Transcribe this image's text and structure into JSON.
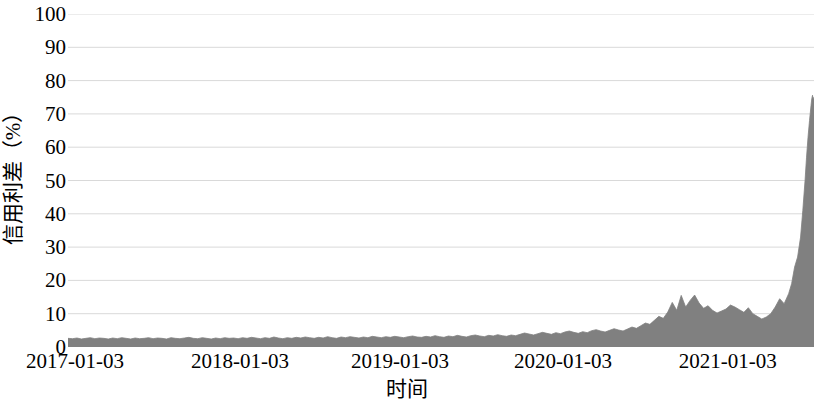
{
  "chart_data": {
    "type": "area",
    "title": "",
    "xlabel": "时间",
    "ylabel": "信用利差（%）",
    "ylim": [
      0,
      100
    ],
    "yticks": [
      0,
      10,
      20,
      30,
      40,
      50,
      60,
      70,
      80,
      90,
      100
    ],
    "ytick_labels": [
      "0",
      "10",
      "20",
      "30",
      "40",
      "50",
      "60",
      "70",
      "80",
      "90",
      "100"
    ],
    "xticks": [
      "2017-01-03",
      "2018-01-03",
      "2019-01-03",
      "2020-01-03",
      "2021-01-03"
    ],
    "xtick_positions_frac": [
      0.0094,
      0.2305,
      0.445,
      0.6634,
      0.8845
    ],
    "grid": true,
    "grid_color": "#d9d9d9",
    "legend": "none",
    "series": [
      {
        "name": "信用利差",
        "color": "#808080",
        "fill": "#808080",
        "x": [
          0.0,
          0.006,
          0.012,
          0.018,
          0.024,
          0.03,
          0.036,
          0.042,
          0.048,
          0.054,
          0.06,
          0.066,
          0.072,
          0.078,
          0.084,
          0.09,
          0.096,
          0.102,
          0.108,
          0.114,
          0.12,
          0.126,
          0.132,
          0.138,
          0.144,
          0.15,
          0.156,
          0.162,
          0.168,
          0.174,
          0.18,
          0.186,
          0.192,
          0.198,
          0.204,
          0.21,
          0.216,
          0.222,
          0.228,
          0.234,
          0.24,
          0.246,
          0.252,
          0.258,
          0.264,
          0.27,
          0.276,
          0.282,
          0.288,
          0.294,
          0.3,
          0.306,
          0.312,
          0.318,
          0.324,
          0.33,
          0.336,
          0.342,
          0.348,
          0.354,
          0.36,
          0.366,
          0.372,
          0.378,
          0.384,
          0.39,
          0.396,
          0.402,
          0.408,
          0.414,
          0.42,
          0.426,
          0.432,
          0.438,
          0.444,
          0.45,
          0.456,
          0.462,
          0.468,
          0.474,
          0.48,
          0.486,
          0.492,
          0.498,
          0.504,
          0.51,
          0.516,
          0.522,
          0.528,
          0.534,
          0.54,
          0.546,
          0.552,
          0.558,
          0.564,
          0.57,
          0.576,
          0.582,
          0.588,
          0.594,
          0.6,
          0.606,
          0.612,
          0.618,
          0.624,
          0.63,
          0.636,
          0.642,
          0.648,
          0.654,
          0.66,
          0.666,
          0.672,
          0.678,
          0.684,
          0.69,
          0.696,
          0.702,
          0.708,
          0.714,
          0.72,
          0.726,
          0.732,
          0.738,
          0.744,
          0.75,
          0.756,
          0.762,
          0.768,
          0.774,
          0.78,
          0.786,
          0.792,
          0.798,
          0.804,
          0.81,
          0.816,
          0.822,
          0.828,
          0.834,
          0.84,
          0.846,
          0.852,
          0.858,
          0.864,
          0.87,
          0.876,
          0.882,
          0.888,
          0.894,
          0.9,
          0.906,
          0.912,
          0.918,
          0.924,
          0.93,
          0.936,
          0.942,
          0.948,
          0.954,
          0.96,
          0.966,
          0.97,
          0.974,
          0.978,
          0.982,
          0.985,
          0.988,
          0.99,
          0.992,
          0.994,
          0.996,
          0.997,
          0.998,
          0.999,
          1.0
        ],
        "y": [
          2.6,
          2.5,
          2.7,
          2.4,
          2.6,
          2.8,
          2.5,
          2.7,
          2.6,
          2.4,
          2.7,
          2.5,
          2.8,
          2.6,
          2.4,
          2.7,
          2.5,
          2.6,
          2.8,
          2.5,
          2.7,
          2.6,
          2.4,
          2.8,
          2.6,
          2.5,
          2.7,
          2.9,
          2.6,
          2.5,
          2.8,
          2.6,
          2.4,
          2.7,
          2.5,
          2.8,
          2.6,
          2.7,
          2.5,
          2.8,
          2.6,
          2.9,
          2.7,
          2.5,
          2.8,
          2.6,
          3.0,
          2.7,
          2.5,
          2.8,
          2.6,
          2.9,
          2.7,
          3.0,
          2.8,
          2.6,
          2.9,
          2.7,
          3.1,
          2.8,
          2.6,
          3.0,
          2.8,
          3.1,
          2.9,
          2.7,
          3.0,
          2.8,
          3.2,
          3.0,
          2.8,
          3.1,
          2.9,
          3.2,
          3.0,
          2.8,
          3.1,
          3.3,
          3.0,
          2.9,
          3.2,
          3.0,
          3.4,
          3.1,
          2.9,
          3.3,
          3.1,
          3.5,
          3.2,
          3.0,
          3.4,
          3.6,
          3.3,
          3.1,
          3.5,
          3.3,
          3.7,
          3.4,
          3.2,
          3.6,
          3.4,
          3.8,
          4.2,
          3.9,
          3.6,
          4.0,
          4.4,
          4.1,
          3.8,
          4.3,
          4.0,
          4.5,
          4.8,
          4.4,
          4.1,
          4.6,
          4.3,
          4.9,
          5.2,
          4.8,
          4.5,
          5.0,
          5.5,
          5.1,
          4.8,
          5.4,
          6.0,
          5.6,
          6.4,
          7.2,
          6.8,
          8.0,
          9.2,
          8.6,
          10.5,
          13.4,
          11.0,
          15.5,
          12.0,
          14.0,
          15.6,
          13.2,
          11.6,
          12.4,
          11.0,
          10.2,
          10.8,
          11.4,
          12.6,
          12.0,
          11.2,
          10.4,
          11.8,
          10.0,
          9.2,
          8.4,
          9.0,
          10.0,
          12.0,
          14.5,
          13.0,
          16.0,
          19.0,
          24.0,
          27.0,
          33.0,
          41.0,
          50.0,
          57.0,
          63.0,
          68.0,
          72.5,
          74.5,
          75.6,
          74.0,
          75.0
        ]
      }
    ]
  },
  "axes": {
    "ylabel_text": "信用利差（%）",
    "xlabel_text": "时间"
  }
}
